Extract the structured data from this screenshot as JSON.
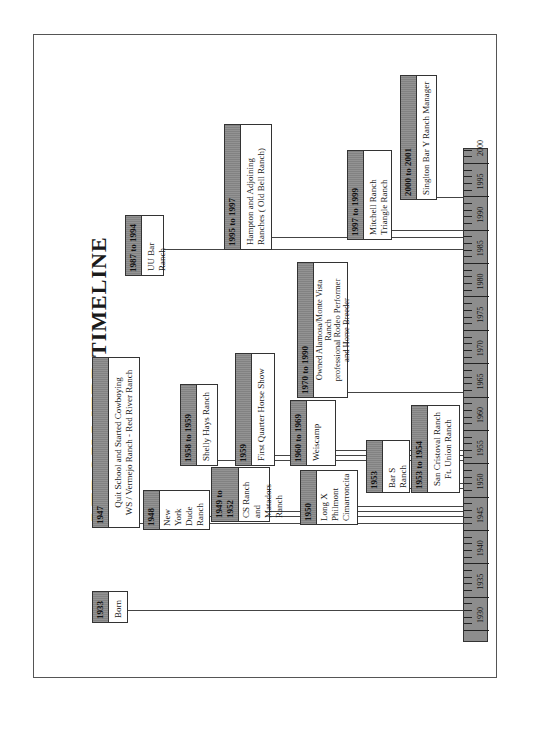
{
  "document": {
    "title": "LEROY  WEBB TIMELINE"
  },
  "axis": {
    "start_year": 1930,
    "end_year": 2002,
    "labels": [
      "1930",
      "1935",
      "1940",
      "1945",
      "1950",
      "1955",
      "1960",
      "1965",
      "1970",
      "1975",
      "1980",
      "1985",
      "1990",
      "1995",
      "2000"
    ]
  },
  "events": [
    {
      "id": "born",
      "date": "1933",
      "text": "Born"
    },
    {
      "id": "quit-school",
      "date": "1947",
      "text": "Quit School and Started Cowboying\nWS / Vermejo Ranch - Red River Ranch"
    },
    {
      "id": "new-york-dude",
      "date": "1948",
      "text": "New\nYork\nDude\nRanch"
    },
    {
      "id": "cs-ranch",
      "date": "1949 to 1952",
      "text": "CS Ranch\nand\nMatadors\nRanch"
    },
    {
      "id": "long-x",
      "date": "1950",
      "text": "Long X\nPhilmont\nCimarroncita"
    },
    {
      "id": "bar-s",
      "date": "1953",
      "text": "Bar S\nRanch"
    },
    {
      "id": "san-cristoval",
      "date": "1953 to 1954",
      "text": "San Cristoval Ranch\nFt. Union Ranch"
    },
    {
      "id": "shelly-hays",
      "date": "1958 to 1959",
      "text": "Shelly Hays Ranch"
    },
    {
      "id": "first-quarter-horse",
      "date": "1959",
      "text": "First Quarter Horse Show"
    },
    {
      "id": "weiscamp",
      "date": "1960 to 1969",
      "text": "Weiscamp"
    },
    {
      "id": "alamosa",
      "date": "1970 to 1990",
      "text": "Owned Alamosa/Monte Vista\nRanch\nprofessional Rodeo Performer\nand Horse Breeder"
    },
    {
      "id": "uu-bar",
      "date": "1987 to 1994",
      "text": "UU Bar\nRanch"
    },
    {
      "id": "hampton",
      "date": "1995 to 1997",
      "text": "Hampton and Adjoining\nRanches ( Old Bell Ranch)"
    },
    {
      "id": "mitchell",
      "date": "1997 to 1999",
      "text": "Mitchell Ranch\nTriangle Ranch"
    },
    {
      "id": "singlton",
      "date": "2000 to 2001",
      "text": "Singlton Bar Y Ranch Manager"
    }
  ],
  "colors": {
    "header_fill": "#8a8a8a",
    "axis_fill": "#8d8d8d",
    "border": "#333333"
  }
}
